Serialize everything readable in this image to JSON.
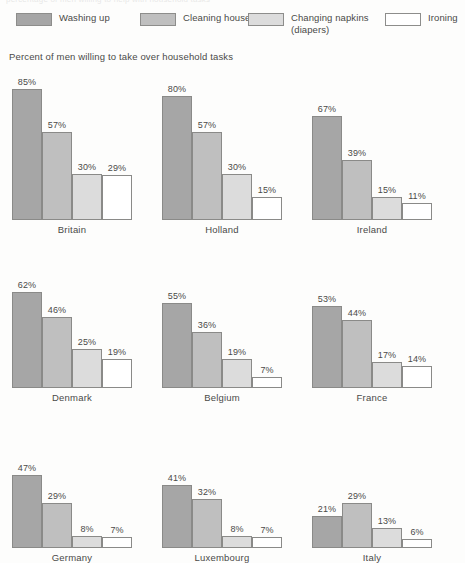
{
  "scan_artifact": {
    "clipped_top_text": "percentage of men willing to help with household tasks"
  },
  "subtitle": "Percent of men willing to take over household tasks",
  "legend": {
    "items": [
      {
        "label": "Washing up",
        "color": "#a6a6a6",
        "x": 16,
        "swatch": "legend-swatch-washing-up"
      },
      {
        "label": "Cleaning house",
        "color": "#bfbfbf",
        "x": 140,
        "swatch": "legend-swatch-cleaning-house"
      },
      {
        "label": "Changing napkins\n(diapers)",
        "color": "#dcdcdc",
        "x": 248,
        "swatch": "legend-swatch-changing-napkins"
      },
      {
        "label": "Ironing",
        "color": "#ffffff",
        "x": 385,
        "swatch": "legend-swatch-ironing"
      }
    ]
  },
  "chart_data": {
    "type": "bar",
    "title": "Percent of men willing to take over household tasks",
    "xlabel": "",
    "ylabel": "Percent",
    "ylim": [
      0,
      85
    ],
    "grid": false,
    "legend_position": "top",
    "value_suffix": "%",
    "series_names": [
      "Washing up",
      "Cleaning house",
      "Changing napkins (diapers)",
      "Ironing"
    ],
    "series_colors": [
      "#a6a6a6",
      "#bfbfbf",
      "#dcdcdc",
      "#ffffff"
    ],
    "categories": [
      "Britain",
      "Holland",
      "Ireland",
      "Denmark",
      "Belgium",
      "France",
      "Germany",
      "Luxembourg",
      "Italy"
    ],
    "series": [
      {
        "name": "Washing up",
        "values": [
          85,
          80,
          67,
          62,
          55,
          53,
          47,
          41,
          21
        ]
      },
      {
        "name": "Cleaning house",
        "values": [
          57,
          57,
          39,
          46,
          36,
          44,
          29,
          32,
          29
        ]
      },
      {
        "name": "Changing napkins (diapers)",
        "values": [
          30,
          30,
          15,
          25,
          19,
          17,
          8,
          8,
          13
        ]
      },
      {
        "name": "Ironing",
        "values": [
          29,
          15,
          11,
          19,
          7,
          14,
          7,
          7,
          6
        ]
      }
    ],
    "panels": [
      {
        "country": "Britain",
        "values": [
          85,
          57,
          30,
          29
        ],
        "labels": [
          "85%",
          "57%",
          "30%",
          "29%"
        ]
      },
      {
        "country": "Holland",
        "values": [
          80,
          57,
          30,
          15
        ],
        "labels": [
          "80%",
          "57%",
          "30%",
          "15%"
        ]
      },
      {
        "country": "Ireland",
        "values": [
          67,
          39,
          15,
          11
        ],
        "labels": [
          "67%",
          "39%",
          "15%",
          "11%"
        ]
      },
      {
        "country": "Denmark",
        "values": [
          62,
          46,
          25,
          19
        ],
        "labels": [
          "62%",
          "46%",
          "25%",
          "19%"
        ]
      },
      {
        "country": "Belgium",
        "values": [
          55,
          36,
          19,
          7
        ],
        "labels": [
          "55%",
          "36%",
          "19%",
          "7%"
        ]
      },
      {
        "country": "France",
        "values": [
          53,
          44,
          17,
          14
        ],
        "labels": [
          "53%",
          "44%",
          "17%",
          "14%"
        ]
      },
      {
        "country": "Germany",
        "values": [
          47,
          29,
          8,
          7
        ],
        "labels": [
          "47%",
          "29%",
          "8%",
          "7%"
        ]
      },
      {
        "country": "Luxembourg",
        "values": [
          41,
          32,
          8,
          7
        ],
        "labels": [
          "41%",
          "32%",
          "8%",
          "7%"
        ]
      },
      {
        "country": "Italy",
        "values": [
          21,
          29,
          13,
          6
        ],
        "labels": [
          "21%",
          "29%",
          "13%",
          "6%"
        ]
      }
    ]
  }
}
